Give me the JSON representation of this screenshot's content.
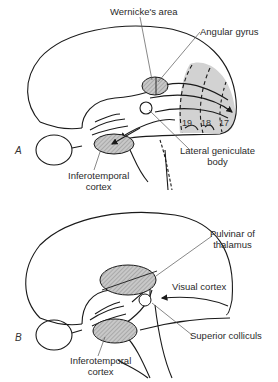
{
  "figure": {
    "panels": [
      {
        "id": "A",
        "label": "A",
        "labels": {
          "wernicke": "Wernicke's area",
          "angular": "Angular gyrus",
          "lgn_line1": "Lateral geniculate",
          "lgn_line2": "body",
          "it_line1": "Inferotemporal",
          "it_line2": "cortex"
        },
        "areas": [
          "19",
          "18",
          "17"
        ]
      },
      {
        "id": "B",
        "label": "B",
        "labels": {
          "pulvinar_line1": "Pulvinar of",
          "pulvinar_line2": "thalamus",
          "visual": "Visual cortex",
          "colliculus": "Superior colliculs",
          "it_line1": "Inferotemporal",
          "it_line2": "cortex"
        }
      }
    ],
    "colors": {
      "stroke": "#1a1a1a",
      "shade": "#cfcfcf",
      "hatch": "#9a9a9a",
      "leader": "#555555"
    }
  }
}
